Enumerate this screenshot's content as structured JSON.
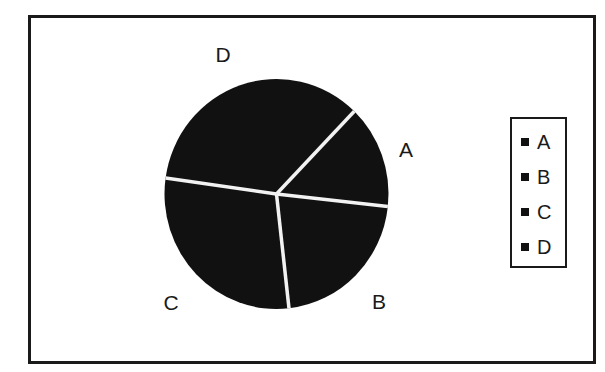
{
  "chart_data": {
    "type": "pie",
    "title": "",
    "categories": [
      "A",
      "B",
      "C",
      "D"
    ],
    "values": [
      14.5,
      21.5,
      29,
      35
    ],
    "start_angle_deg": 44,
    "direction": "clockwise",
    "slice_color": "#111111",
    "divider_color": "#f2f2f2",
    "labels": [
      {
        "text": "A",
        "x": 406,
        "y": 150
      },
      {
        "text": "B",
        "x": 379,
        "y": 302
      },
      {
        "text": "C",
        "x": 171,
        "y": 303
      },
      {
        "text": "D",
        "x": 223,
        "y": 55
      }
    ],
    "legend": {
      "position": "right",
      "entries": [
        "A",
        "B",
        "C",
        "D"
      ]
    }
  },
  "legend": {
    "items": [
      {
        "label": "A"
      },
      {
        "label": "B"
      },
      {
        "label": "C"
      },
      {
        "label": "D"
      }
    ]
  }
}
